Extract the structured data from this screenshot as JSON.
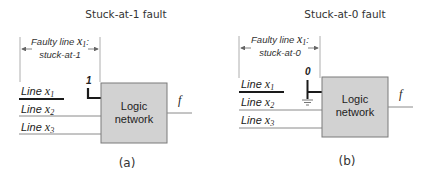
{
  "colors": {
    "box_fill": "#d2d2d2",
    "box_stroke": "#7a7a7a",
    "wire": "#8a8a8a",
    "faulty_wire": "#1a1a1a"
  },
  "panels": [
    {
      "title": "Stuck-at-1 fault",
      "annotation_line1": "Faulty line ",
      "annotation_var": "x",
      "annotation_sub": "1",
      "annotation_colon": ":",
      "annotation_line2": "stuck-at-1",
      "stuck_value": "1",
      "inputs": [
        {
          "label": "Line ",
          "var": "x",
          "sub": "1"
        },
        {
          "label": "Line ",
          "var": "x",
          "sub": "2"
        },
        {
          "label": "Line ",
          "var": "x",
          "sub": "3"
        }
      ],
      "box_line1": "Logic",
      "box_line2": "network",
      "output": "f",
      "caption": "(a)"
    },
    {
      "title": "Stuck-at-0 fault",
      "annotation_line1": "Faulty line ",
      "annotation_var": "x",
      "annotation_sub": "1",
      "annotation_colon": ":",
      "annotation_line2": "stuck-at-0",
      "stuck_value": "0",
      "inputs": [
        {
          "label": "Line ",
          "var": "x",
          "sub": "1"
        },
        {
          "label": "Line ",
          "var": "x",
          "sub": "2"
        },
        {
          "label": "Line ",
          "var": "x",
          "sub": "3"
        }
      ],
      "box_line1": "Logic",
      "box_line2": "network",
      "output": "f",
      "caption": "(b)"
    }
  ]
}
